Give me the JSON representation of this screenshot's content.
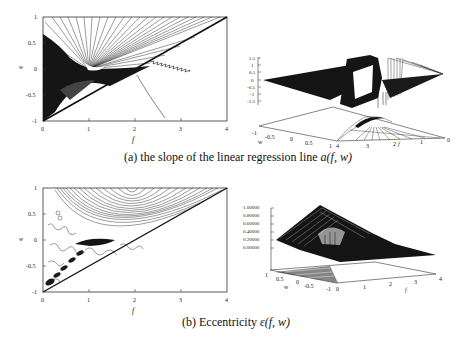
{
  "figure": {
    "panel_a": {
      "caption_prefix": "(a) the slope of the linear regression line ",
      "caption_math": "a(f, w)",
      "contour_plot": {
        "xlabel": "f",
        "ylabel": "w",
        "xticks": [
          "0",
          "1",
          "2",
          "3",
          "4"
        ],
        "yticks": [
          "1",
          "0.5",
          "0",
          "-0.5",
          "-1"
        ]
      },
      "surface_plot": {
        "zticks": [
          "1.5",
          "1",
          "0.5",
          "0",
          "-0.5",
          "-1",
          "-1.5"
        ],
        "w_label": "w",
        "w_ticks": [
          "-1",
          "-0.5",
          "0",
          "0.5",
          "1"
        ],
        "f_label": "f",
        "f_ticks": [
          "4",
          "3",
          "2",
          "1",
          "0"
        ]
      }
    },
    "panel_b": {
      "caption_prefix": "(b) Eccentricity ",
      "caption_math": "ε(f, w)",
      "contour_plot": {
        "xlabel": "f",
        "ylabel": "w",
        "xticks": [
          "0",
          "1",
          "2",
          "3",
          "4"
        ],
        "yticks": [
          "1",
          "0.5",
          "0",
          "-0.5",
          "-1"
        ]
      },
      "surface_plot": {
        "zticks": [
          "1.00000",
          "0.80000",
          "0.60000",
          "0.40000",
          "0.20000",
          "0.00000"
        ],
        "w_label": "w",
        "w_ticks": [
          "1",
          "0.5",
          "0",
          "-0.5",
          "-1"
        ],
        "f_label": "f",
        "f_ticks": [
          "0",
          "1",
          "2",
          "3",
          "4"
        ]
      }
    }
  }
}
